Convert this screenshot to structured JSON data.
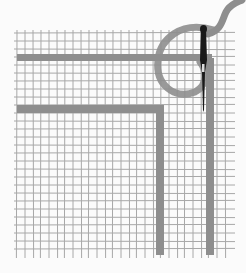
{
  "illustration": {
    "subject": "woven grid with needle and thread",
    "colors": {
      "background": "#fbfbfb",
      "grid_line": "#a8a8a8",
      "thread": "#8e8e8e",
      "needle": "#1a1a1a"
    },
    "grid": {
      "x0": 17,
      "y0": 33,
      "x1": 232,
      "y1": 255,
      "cell": 8
    },
    "bands": [
      {
        "orientation": "horizontal",
        "y": 54,
        "x_start": 17,
        "x_end": 212,
        "thickness": 7
      },
      {
        "orientation": "horizontal",
        "y": 105,
        "x_start": 17,
        "x_end": 164,
        "thickness": 8
      },
      {
        "orientation": "vertical",
        "x": 156,
        "y_start": 105,
        "y_end": 255,
        "thickness": 8
      },
      {
        "orientation": "vertical",
        "x": 206,
        "y_start": 58,
        "y_end": 255,
        "thickness": 8
      }
    ]
  }
}
